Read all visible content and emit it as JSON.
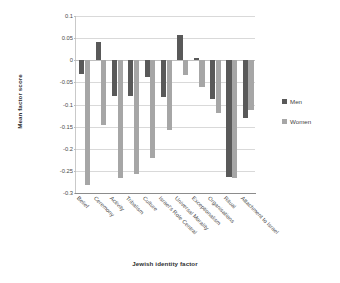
{
  "chart_data": {
    "type": "bar",
    "title": "",
    "xlabel": "Jewish identity factor",
    "ylabel": "Mean factor score",
    "ylim": [
      -0.3,
      0.1
    ],
    "ytick_step": 0.05,
    "yticks": [
      "0.1",
      "0.05",
      "0",
      "-0.05",
      "-0.1",
      "-0.15",
      "-0.2",
      "-0.25",
      "-0.3"
    ],
    "ytick_values": [
      0.1,
      0.05,
      0,
      -0.05,
      -0.1,
      -0.15,
      -0.2,
      -0.25,
      -0.3
    ],
    "grid": true,
    "legend_position": "right",
    "categories": [
      "Belief",
      "Ceremony",
      "Activity",
      "Tribalism",
      "Culture",
      "Israel's Role Central",
      "Universal Morality",
      "Exceptionalism",
      "Organisations",
      "Ritual",
      "Attachment to Israel"
    ],
    "series": [
      {
        "name": "Men",
        "color": "#595959",
        "values": [
          -0.032,
          0.042,
          -0.08,
          -0.08,
          -0.038,
          -0.082,
          0.058,
          0.005,
          -0.088,
          -0.263,
          -0.131
        ]
      },
      {
        "name": "Women",
        "color": "#a6a6a6",
        "values": [
          -0.283,
          -0.147,
          -0.265,
          -0.257,
          -0.222,
          -0.157,
          -0.033,
          -0.06,
          -0.12,
          -0.265,
          -0.112
        ]
      }
    ]
  },
  "legend": {
    "items": [
      {
        "label": "Men"
      },
      {
        "label": "Women"
      }
    ]
  }
}
